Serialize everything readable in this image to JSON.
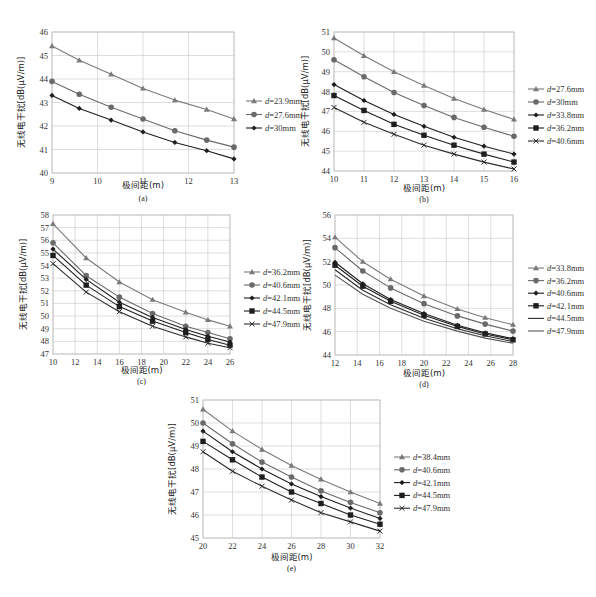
{
  "y_axis_label": "无线电干扰[dB(μV/m)]",
  "x_axis_label": "极间距(m)",
  "chart_data": [
    {
      "id": "a",
      "type": "line",
      "caption": "(a)",
      "xlabel": "极间距(m)",
      "ylabel": "无线电干扰[dB(μV/m)]",
      "xlim": [
        9,
        13
      ],
      "ylim": [
        40,
        46
      ],
      "xticks": [
        9,
        10,
        11,
        12,
        13
      ],
      "yticks": [
        40,
        41,
        42,
        43,
        44,
        45,
        46
      ],
      "grid": true,
      "legend_position": "right",
      "x": [
        9,
        9.6,
        10.3,
        11,
        11.7,
        12.4,
        13
      ],
      "series": [
        {
          "name": "d=23.9mm",
          "d": "=23.9mm",
          "marker": "triangle",
          "color": "#7a7a7a",
          "values": [
            45.4,
            44.8,
            44.2,
            43.6,
            43.1,
            42.7,
            42.3
          ]
        },
        {
          "name": "d=27.6mm",
          "d": "=27.6mm",
          "marker": "circle",
          "color": "#6a6a6a",
          "values": [
            43.9,
            43.35,
            42.8,
            42.3,
            41.8,
            41.4,
            41.1
          ]
        },
        {
          "name": "d=30mm",
          "d": "=30mm",
          "marker": "diamond",
          "color": "#1e1e1e",
          "values": [
            43.3,
            42.75,
            42.25,
            41.75,
            41.3,
            40.95,
            40.6
          ]
        }
      ]
    },
    {
      "id": "b",
      "type": "line",
      "caption": "(b)",
      "xlabel": "极间距(m)",
      "ylabel": "无线电干扰[dB(μV/m)]",
      "xlim": [
        10,
        16
      ],
      "ylim": [
        44,
        51
      ],
      "xticks": [
        10,
        11,
        12,
        13,
        14,
        15,
        16
      ],
      "yticks": [
        44,
        45,
        46,
        47,
        48,
        49,
        50,
        51
      ],
      "grid": true,
      "legend_position": "right",
      "x": [
        10,
        11,
        12,
        13,
        14,
        15,
        16
      ],
      "series": [
        {
          "name": "d=27.6mm",
          "d": "=27.6mm",
          "marker": "triangle",
          "color": "#7a7a7a",
          "values": [
            50.7,
            49.8,
            49.0,
            48.3,
            47.65,
            47.1,
            46.6
          ]
        },
        {
          "name": "d=30mm",
          "d": "=30mm",
          "marker": "circle",
          "color": "#6a6a6a",
          "values": [
            49.6,
            48.75,
            47.95,
            47.3,
            46.7,
            46.2,
            45.75
          ]
        },
        {
          "name": "d=33.8mm",
          "d": "=33.8mm",
          "marker": "diamond",
          "color": "#1e1e1e",
          "values": [
            48.35,
            47.55,
            46.85,
            46.25,
            45.7,
            45.25,
            44.85
          ]
        },
        {
          "name": "d=36.2mm",
          "d": "=36.2mm",
          "marker": "square",
          "color": "#1e1e1e",
          "values": [
            47.8,
            47.05,
            46.35,
            45.8,
            45.3,
            44.85,
            44.45
          ]
        },
        {
          "name": "d=40.6mm",
          "d": "=40.6mm",
          "marker": "x",
          "color": "#2a2a2a",
          "values": [
            47.2,
            46.45,
            45.85,
            45.3,
            44.85,
            44.45,
            44.1
          ]
        }
      ]
    },
    {
      "id": "c",
      "type": "line",
      "caption": "(c)",
      "xlabel": "极间距(m)",
      "ylabel": "无线电干扰[dB(μV/m)]",
      "xlim": [
        10,
        26
      ],
      "ylim": [
        47,
        58
      ],
      "xticks": [
        10,
        12,
        14,
        16,
        18,
        20,
        22,
        24,
        26
      ],
      "yticks": [
        47,
        48,
        49,
        50,
        51,
        52,
        53,
        54,
        55,
        56,
        57,
        58
      ],
      "grid": true,
      "legend_position": "right",
      "x": [
        10,
        13,
        16,
        19,
        22,
        24,
        26
      ],
      "series": [
        {
          "name": "d=36.2mm",
          "d": "=36.2mm",
          "marker": "triangle",
          "color": "#7a7a7a",
          "values": [
            57.3,
            54.6,
            52.7,
            51.3,
            50.3,
            49.7,
            49.2
          ]
        },
        {
          "name": "d=40.6mm",
          "d": "=40.6mm",
          "marker": "circle",
          "color": "#6a6a6a",
          "values": [
            55.8,
            53.2,
            51.5,
            50.2,
            49.2,
            48.7,
            48.2
          ]
        },
        {
          "name": "d=42.1mm",
          "d": "=42.1mm",
          "marker": "diamond",
          "color": "#1e1e1e",
          "values": [
            55.3,
            52.9,
            51.1,
            49.9,
            48.95,
            48.4,
            47.95
          ]
        },
        {
          "name": "d=44.5mm",
          "d": "=44.5mm",
          "marker": "square",
          "color": "#1e1e1e",
          "values": [
            54.8,
            52.45,
            50.75,
            49.6,
            48.7,
            48.15,
            47.7
          ]
        },
        {
          "name": "d=47.9mm",
          "d": "=47.9mm",
          "marker": "x",
          "color": "#2a2a2a",
          "values": [
            54.15,
            51.9,
            50.35,
            49.2,
            48.35,
            47.85,
            47.5
          ]
        }
      ]
    },
    {
      "id": "d",
      "type": "line",
      "caption": "(d)",
      "xlabel": "极间距(m)",
      "ylabel": "无线电干扰[dB(μV/m)]",
      "xlim": [
        12,
        28
      ],
      "ylim": [
        44,
        56
      ],
      "xticks": [
        12,
        14,
        16,
        18,
        20,
        22,
        24,
        26,
        28
      ],
      "yticks": [
        44,
        46,
        48,
        50,
        52,
        54,
        56
      ],
      "grid": true,
      "legend_position": "right",
      "x": [
        12,
        14.5,
        17,
        20,
        23,
        25.5,
        28
      ],
      "series": [
        {
          "name": "d=33.8mm",
          "d": "=33.8mm",
          "marker": "triangle",
          "color": "#7a7a7a",
          "values": [
            54.1,
            52.0,
            50.5,
            49.05,
            47.95,
            47.2,
            46.6
          ]
        },
        {
          "name": "d=36.2mm",
          "d": "=36.2mm",
          "marker": "circle",
          "color": "#6a6a6a",
          "values": [
            53.2,
            51.2,
            49.75,
            48.4,
            47.35,
            46.65,
            46.05
          ]
        },
        {
          "name": "d=40.6mm",
          "d": "=40.6mm",
          "marker": "diamond",
          "color": "#1e1e1e",
          "values": [
            51.95,
            50.1,
            48.75,
            47.55,
            46.55,
            45.9,
            45.4
          ]
        },
        {
          "name": "d=42.1mm",
          "d": "=42.1mm",
          "marker": "square",
          "color": "#1e1e1e",
          "values": [
            51.7,
            49.9,
            48.6,
            47.4,
            46.45,
            45.8,
            45.3
          ]
        },
        {
          "name": "d=44.5mm",
          "d": "=44.5mm",
          "marker": "line",
          "color": "#2a2a2a",
          "values": [
            51.3,
            49.55,
            48.3,
            47.15,
            46.25,
            45.65,
            45.15
          ]
        },
        {
          "name": "d=47.9mm",
          "d": "=47.9mm",
          "marker": "line",
          "color": "#555555",
          "values": [
            50.85,
            49.2,
            48.0,
            46.9,
            46.05,
            45.45,
            45.0
          ]
        }
      ]
    },
    {
      "id": "e",
      "type": "line",
      "caption": "(e)",
      "xlabel": "极间距(m)",
      "ylabel": "无线电干扰[dB(μV/m)]",
      "xlim": [
        20,
        32
      ],
      "ylim": [
        45,
        51
      ],
      "xticks": [
        20,
        22,
        24,
        26,
        28,
        30,
        32
      ],
      "yticks": [
        45,
        46,
        47,
        48,
        49,
        50,
        51
      ],
      "grid": true,
      "legend_position": "right",
      "x": [
        20,
        22,
        24,
        26,
        28,
        30,
        32
      ],
      "series": [
        {
          "name": "d=38.4mm",
          "d": "=38.4mm",
          "marker": "triangle",
          "color": "#7a7a7a",
          "values": [
            50.6,
            49.65,
            48.85,
            48.15,
            47.55,
            47.0,
            46.5
          ]
        },
        {
          "name": "d=40.6mm",
          "d": "=40.6mm",
          "marker": "circle",
          "color": "#6a6a6a",
          "values": [
            50.0,
            49.1,
            48.3,
            47.65,
            47.05,
            46.55,
            46.1
          ]
        },
        {
          "name": "d=42.1mm",
          "d": "=42.1mm",
          "marker": "diamond",
          "color": "#1e1e1e",
          "values": [
            49.65,
            48.75,
            48.0,
            47.35,
            46.8,
            46.3,
            45.85
          ]
        },
        {
          "name": "d=44.5mm",
          "d": "=44.5mm",
          "marker": "square",
          "color": "#1e1e1e",
          "values": [
            49.2,
            48.4,
            47.65,
            47.0,
            46.5,
            46.0,
            45.6
          ]
        },
        {
          "name": "d=47.9mm",
          "d": "=47.9mm",
          "marker": "x",
          "color": "#2a2a2a",
          "values": [
            48.75,
            47.9,
            47.25,
            46.65,
            46.1,
            45.7,
            45.3
          ]
        }
      ]
    }
  ]
}
